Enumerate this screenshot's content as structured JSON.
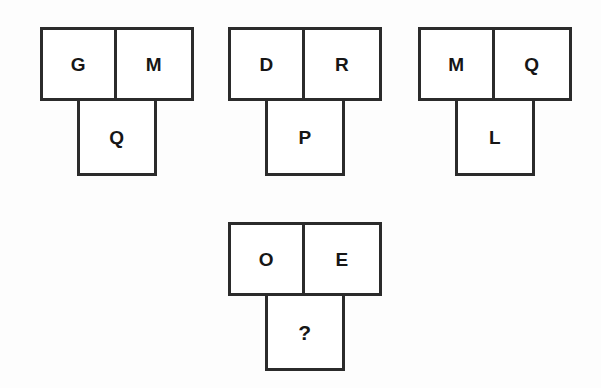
{
  "page": {
    "background_color": "#fdfdfd",
    "ink_color": "#2b2b2b",
    "text_color": "#161616"
  },
  "puzzle": {
    "type": "letter-analogy",
    "layout": "three example figures in a top row, one incomplete figure below",
    "unknown_marker": "?",
    "groups": [
      {
        "id": "group-1",
        "role": "example",
        "top_left": "G",
        "top_right": "M",
        "bottom": "Q"
      },
      {
        "id": "group-2",
        "role": "example",
        "top_left": "D",
        "top_right": "R",
        "bottom": "P"
      },
      {
        "id": "group-3",
        "role": "example",
        "top_left": "M",
        "top_right": "Q",
        "bottom": "L"
      },
      {
        "id": "group-4",
        "role": "question",
        "top_left": "O",
        "top_right": "E",
        "bottom": "?"
      }
    ]
  }
}
